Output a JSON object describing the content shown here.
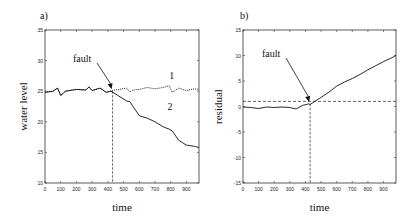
{
  "chart_data": [
    {
      "type": "line",
      "panel_label": "a)",
      "title": "",
      "xlabel": "time",
      "ylabel": "water level",
      "xlim": [
        0,
        980
      ],
      "ylim": [
        10,
        35
      ],
      "xticks": [
        0,
        100,
        200,
        300,
        400,
        500,
        600,
        700,
        800,
        900
      ],
      "yticks": [
        10,
        15,
        20,
        25,
        30,
        35
      ],
      "grid": false,
      "series": [
        {
          "name": "1",
          "style": "dotted",
          "x": [
            0,
            50,
            80,
            100,
            130,
            200,
            260,
            280,
            300,
            350,
            390,
            420,
            470,
            520,
            540,
            560,
            600,
            650,
            700,
            750,
            790,
            810,
            850,
            900,
            950,
            980
          ],
          "y": [
            24.8,
            25.0,
            25.5,
            24.3,
            25.0,
            25.3,
            25.2,
            25.7,
            25.1,
            25.5,
            24.8,
            25.1,
            25.3,
            25.5,
            24.9,
            25.2,
            25.3,
            25.6,
            25.4,
            25.6,
            25.9,
            24.8,
            25.5,
            25.1,
            25.4,
            25.3
          ]
        },
        {
          "name": "2",
          "style": "solid",
          "x": [
            0,
            50,
            80,
            100,
            130,
            200,
            260,
            280,
            300,
            350,
            390,
            420,
            470,
            520,
            540,
            560,
            600,
            650,
            700,
            750,
            790,
            810,
            850,
            900,
            950,
            980
          ],
          "y": [
            24.8,
            25.0,
            25.5,
            24.3,
            25.0,
            25.3,
            25.2,
            25.7,
            25.1,
            25.5,
            24.8,
            25.0,
            24.2,
            23.4,
            23.3,
            22.5,
            21.0,
            20.6,
            20.0,
            19.2,
            18.8,
            18.5,
            17.0,
            16.2,
            16.0,
            15.8
          ]
        }
      ],
      "annotations": [
        {
          "text": "fault",
          "x": 430,
          "y": 25.0
        },
        {
          "text": "1",
          "x": 790,
          "y": 27.0
        },
        {
          "text": "2",
          "x": 780,
          "y": 22.0
        }
      ],
      "fault_time": 430
    },
    {
      "type": "line",
      "panel_label": "b)",
      "title": "",
      "xlabel": "time",
      "ylabel": "residual",
      "xlim": [
        0,
        980
      ],
      "ylim": [
        -15,
        15
      ],
      "xticks": [
        0,
        100,
        200,
        300,
        400,
        500,
        600,
        700,
        800,
        900
      ],
      "yticks": [
        -15,
        -10,
        -5,
        0,
        5,
        10,
        15
      ],
      "grid": false,
      "threshold": 1,
      "series": [
        {
          "name": "residual",
          "style": "solid",
          "x": [
            0,
            50,
            100,
            150,
            200,
            250,
            300,
            340,
            380,
            420,
            430,
            460,
            500,
            550,
            600,
            650,
            700,
            750,
            800,
            850,
            900,
            950,
            980
          ],
          "y": [
            -0.1,
            -0.2,
            -0.4,
            -0.1,
            -0.2,
            -0.1,
            -0.2,
            -0.5,
            0.2,
            0.5,
            0.4,
            1.0,
            1.8,
            2.8,
            4.0,
            4.8,
            5.5,
            6.3,
            7.2,
            8.0,
            8.8,
            9.5,
            10.0
          ]
        }
      ],
      "annotations": [
        {
          "text": "fault",
          "x": 430,
          "y": 0.5
        }
      ],
      "fault_time": 430
    }
  ]
}
